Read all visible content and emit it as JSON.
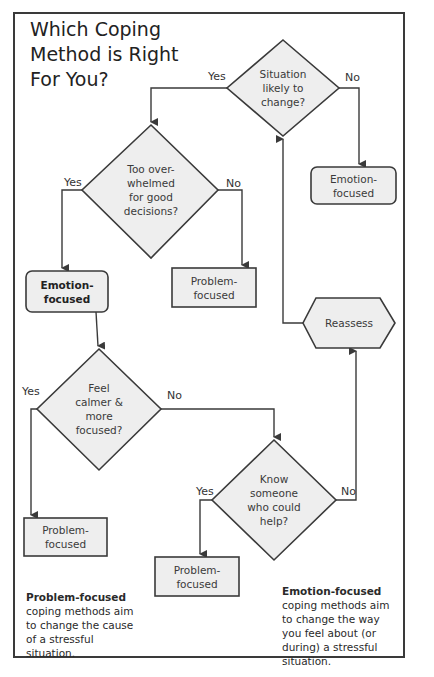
{
  "title": "Which Coping\nMethod is Right\nFor You?",
  "colors": {
    "node_fill": "#eeeeee",
    "stroke": "#3a3a3a",
    "background": "#ffffff"
  },
  "nodes": {
    "q_situation": {
      "type": "decision",
      "text": "Situation\nlikely to\nchange?"
    },
    "q_overwhelmed": {
      "type": "decision",
      "text": "Too over-\nwhelmed\nfor good\ndecisions?"
    },
    "r_emotion_top": {
      "type": "outcome",
      "text": "Emotion-\nfocused"
    },
    "r_emotion_left": {
      "type": "outcome",
      "text": "Emotion-\nfocused"
    },
    "r_problem_mid": {
      "type": "outcome",
      "text": "Problem-\nfocused"
    },
    "reassess": {
      "type": "process",
      "text": "Reassess"
    },
    "q_calmer": {
      "type": "decision",
      "text": "Feel\ncalmer &\nmore\nfocused?"
    },
    "q_know": {
      "type": "decision",
      "text": "Know\nsomeone\nwho could\nhelp?"
    },
    "r_problem_left": {
      "type": "outcome",
      "text": "Problem-\nfocused"
    },
    "r_problem_bottom": {
      "type": "outcome",
      "text": "Problem-\nfocused"
    }
  },
  "edges": {
    "situation_yes": "Yes",
    "situation_no": "No",
    "overwhelmed_yes": "Yes",
    "overwhelmed_no": "No",
    "calmer_yes": "Yes",
    "calmer_no": "No",
    "know_yes": "Yes",
    "know_no": "No"
  },
  "notes": {
    "problem": {
      "bold": "Problem-focused",
      "rest": " coping methods aim to change the cause of a stressful situation."
    },
    "emotion": {
      "bold": "Emotion-focused",
      "rest": " coping methods aim to change the way you feel about (or during) a stressful situation."
    }
  }
}
